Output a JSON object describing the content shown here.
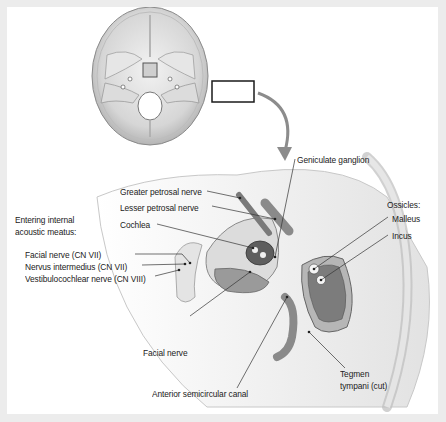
{
  "figure": {
    "labels": {
      "geniculate_ganglion": "Geniculate ganglion",
      "greater_petrosal_nerve": "Greater petrosal nerve",
      "lesser_petrosal_nerve": "Lesser petrosal nerve",
      "cochlea": "Cochlea",
      "entering_line1": "Entering internal",
      "entering_line2": "acoustic meatus:",
      "facial_nerve_cn7": "Facial nerve (CN VII)",
      "nervus_intermedius": "Nervus intermedius (CN VII)",
      "vestibulocochlear": "Vestibulocochlear nerve (CN VIII)",
      "ossicles": "Ossicles:",
      "malleus": "Malleus",
      "incus": "Incus",
      "facial_nerve": "Facial nerve",
      "anterior_canal": "Anterior semicircular canal",
      "tegmen_line1": "Tegmen",
      "tegmen_line2": "tympani (cut)"
    }
  }
}
